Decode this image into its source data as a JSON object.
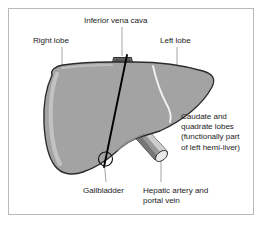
{
  "figure": {
    "background_color": "#ffffff",
    "frame_color": "#b9b9b9"
  },
  "colors": {
    "liver_fill": "#a3a3a3",
    "liver_highlight": "#c4c4c4",
    "liver_outline": "#2b2b2b",
    "vessel_fill": "#9a9a9a",
    "vessel_dark": "#6e6e6e",
    "vessel_light": "#d8d8d8",
    "ivc_fill": "#7c7c7c",
    "division_line": "#000000",
    "leader_line": "#8c8c8c",
    "text": "#1d1d1d"
  },
  "labels": {
    "inferior_vena_cava": "Inferior vena cava",
    "right_lobe": "Right lobe",
    "left_lobe": "Left lobe",
    "caudate_quadrate_line1": "Caudate and",
    "caudate_quadrate_line2": "quadrate lobes",
    "caudate_quadrate_line3": "(functionally part",
    "caudate_quadrate_line4": "of left hemi-liver)",
    "gallbladder": "Gallbladder",
    "hepatic_line1": "Hepatic artery and",
    "hepatic_line2": "portal vein"
  },
  "structures": [
    {
      "name": "liver-body",
      "label": "Liver"
    },
    {
      "name": "inferior-vena-cava",
      "label": "Inferior vena cava"
    },
    {
      "name": "right-lobe",
      "label": "Right lobe"
    },
    {
      "name": "left-lobe",
      "label": "Left lobe"
    },
    {
      "name": "caudate-quadrate-lobes",
      "label": "Caudate and quadrate lobes"
    },
    {
      "name": "gallbladder",
      "label": "Gallbladder"
    },
    {
      "name": "hepatic-artery-portal-vein",
      "label": "Hepatic artery and portal vein"
    },
    {
      "name": "cantlie-line",
      "label": "Functional division line"
    }
  ]
}
